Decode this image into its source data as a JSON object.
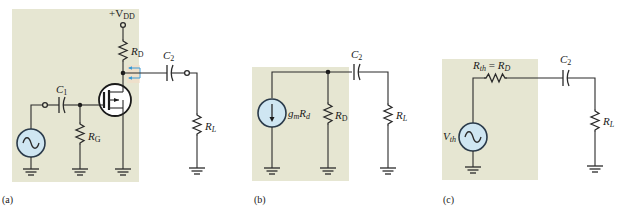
{
  "figure": {
    "panels": [
      {
        "id": "a",
        "caption": "(a)",
        "title": "Common-source MOSFET amplifier",
        "labels": {
          "supply_main": "+V",
          "supply_sub": "DD",
          "rd_main": "R",
          "rd_sub": "D",
          "c1_main": "C",
          "c1_sub": "1",
          "c2_main": "C",
          "c2_sub": "2",
          "rg_main": "R",
          "rg_sub": "G",
          "rl_main": "R",
          "rl_sub": "L"
        }
      },
      {
        "id": "b",
        "caption": "(b)",
        "title": "Norton equivalent output circuit",
        "labels": {
          "source_main": "g",
          "source_sub1": "m",
          "source_main2": "R",
          "source_sub2": "d",
          "rd_main": "R",
          "rd_sub": "D",
          "c2_main": "C",
          "c2_sub": "2",
          "rl_main": "R",
          "rl_sub": "L"
        }
      },
      {
        "id": "c",
        "caption": "(c)",
        "title": "Thevenin equivalent output circuit",
        "labels": {
          "rth_main": "R",
          "rth_sub": "th",
          "rth_eq": " = ",
          "rth_main2": "R",
          "rth_sub2": "D",
          "vth_main": "V",
          "vth_sub": "th",
          "c2_main": "C",
          "c2_sub": "2",
          "rl_main": "R",
          "rl_sub": "L"
        }
      }
    ],
    "colors": {
      "shade": "#e6e6d2",
      "source_fill": "#cfe6f2",
      "source_stroke": "#2a3a4a",
      "arrow": "#3a9ad6",
      "wire": "#2a2a2a"
    }
  }
}
